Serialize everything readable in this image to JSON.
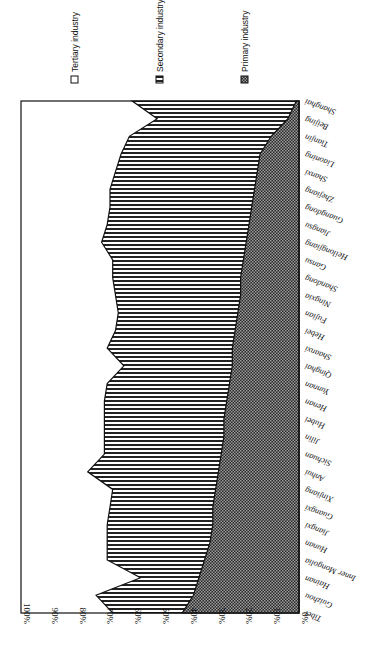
{
  "chart_data": {
    "type": "area",
    "stacked": true,
    "normalized_percent": true,
    "orientation": "rotated-90 (value axis horizontal at bottom, 100% left to 0% right; categories listed down the right side)",
    "title": "",
    "xlabel": "",
    "ylabel": "",
    "ylim": [
      0,
      100
    ],
    "y_ticks": [
      "100%",
      "90%",
      "80%",
      "70%",
      "60%",
      "50%",
      "40%",
      "30%",
      "20%",
      "10%",
      "0%"
    ],
    "grid": false,
    "legend_position": "top (rotated)",
    "categories": [
      "Shanghai",
      "Beijing",
      "Tianjin",
      "Liaoning",
      "Shanxi",
      "Zhejiang",
      "Guangdong",
      "Jiangsu",
      "Heilongjiang",
      "Gansu",
      "Shandong",
      "Ningxia",
      "Fujian",
      "Hebei",
      "Shaanxi",
      "Qinghai",
      "Yunnan",
      "Henan",
      "Hubei",
      "Jilin",
      "Sichuan",
      "Anhui",
      "Xinjiang",
      "Guangxi",
      "Jiangxi",
      "Hunan",
      "Inner Mongolia",
      "Hainan",
      "Guizhou",
      "Tibet"
    ],
    "series": [
      {
        "name": "Primary industry",
        "pattern": "checker",
        "values": [
          1,
          4,
          10,
          14,
          15,
          16,
          17,
          18,
          19,
          20,
          21,
          21,
          22,
          23,
          24,
          24,
          25,
          26,
          27,
          27,
          28,
          29,
          30,
          31,
          31,
          32,
          34,
          36,
          38,
          42
        ]
      },
      {
        "name": "Secondary industry",
        "pattern": "horizontal-stripes",
        "values": [
          59,
          47,
          51,
          50,
          51,
          52,
          51,
          51,
          52,
          47,
          46,
          45,
          43,
          43,
          45,
          39,
          44,
          44,
          43,
          43,
          42,
          47,
          37,
          37,
          38,
          37,
          35,
          21,
          35,
          25
        ]
      },
      {
        "name": "Tertiary industry",
        "pattern": "white",
        "values": [
          40,
          49,
          39,
          36,
          34,
          32,
          32,
          31,
          29,
          33,
          33,
          34,
          35,
          34,
          31,
          37,
          31,
          30,
          30,
          30,
          30,
          24,
          33,
          32,
          31,
          31,
          31,
          43,
          27,
          33
        ]
      }
    ]
  },
  "legend": {
    "items": [
      {
        "label": "Tertiary industry",
        "icon": "white-square-icon"
      },
      {
        "label": "Secondary industry",
        "icon": "striped-square-icon"
      },
      {
        "label": "Primary industry",
        "icon": "checker-square-icon"
      }
    ]
  },
  "colors": {
    "line": "#111111",
    "background": "#ffffff",
    "stripe": "#222222",
    "checker_dark": "#1a1a1a"
  }
}
